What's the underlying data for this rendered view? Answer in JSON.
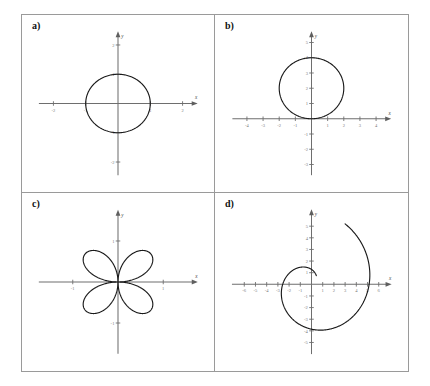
{
  "figure": {
    "panels": [
      {
        "id": "a",
        "label": "a)",
        "xlabel": "x",
        "ylabel": "y",
        "xticks": [
          -2,
          -1,
          1,
          2
        ],
        "yticks": [
          -2,
          -1,
          1,
          2
        ],
        "xticklabels": [
          "-2",
          "-1",
          "1",
          "2"
        ],
        "yticklabels": [
          "-2",
          "-1",
          "1",
          "2"
        ],
        "xlim": [
          -2.45,
          2.45
        ],
        "ylim": [
          -2.45,
          2.45
        ]
      },
      {
        "id": "b",
        "label": "b)",
        "xlabel": "x",
        "ylabel": "y",
        "xticks": [
          -4,
          -3,
          -2,
          -1,
          1,
          2,
          3,
          4
        ],
        "yticks": [
          -3,
          -2,
          -1,
          1,
          2,
          3,
          4,
          5
        ],
        "xticklabels": [
          "-4",
          "-3",
          "-2",
          "-1",
          "1",
          "2",
          "3",
          "4"
        ],
        "yticklabels": [
          "-3",
          "-2",
          "-1",
          "1",
          "2",
          "3",
          "4",
          "5"
        ],
        "xlim": [
          -4.9,
          4.9
        ],
        "ylim": [
          -3.7,
          5.7
        ]
      },
      {
        "id": "c",
        "label": "c)",
        "xlabel": "x",
        "ylabel": "y",
        "xticks": [
          -1,
          1
        ],
        "yticks": [
          -1,
          1
        ],
        "xticklabels": [
          "-1",
          "1"
        ],
        "yticklabels": [
          "-1",
          "1"
        ],
        "xlim": [
          -1.75,
          1.75
        ],
        "ylim": [
          -1.75,
          1.75
        ]
      },
      {
        "id": "d",
        "label": "d)",
        "xlabel": "x",
        "ylabel": "y",
        "xticks": [
          -6,
          -5,
          -4,
          -3,
          -2,
          -1,
          1,
          2,
          3,
          4,
          5,
          6
        ],
        "yticks": [
          -5,
          -4,
          -3,
          -2,
          -1,
          1,
          2,
          3,
          4,
          5
        ],
        "xticklabels": [
          "-6",
          "-5",
          "-4",
          "-3",
          "-2",
          "-1",
          "1",
          "2",
          "3",
          "4",
          "5",
          "6"
        ],
        "yticklabels": [
          "-5",
          "-4",
          "-3",
          "-2",
          "-1",
          "1",
          "2",
          "3",
          "4",
          "5"
        ],
        "xlim": [
          -7.1,
          7.1
        ],
        "ylim": [
          -6.0,
          6.4
        ]
      }
    ]
  },
  "chart_data": [
    {
      "type": "line",
      "panel": "a",
      "title": "",
      "subtitle": "",
      "xlabel": "x",
      "ylabel": "y",
      "xlim": [
        -2.45,
        2.45
      ],
      "ylim": [
        -2.45,
        2.45
      ],
      "grid": false,
      "legend": "none",
      "coordinate_system": "polar",
      "curve": "circle of radius 1 centred at the origin",
      "polar_equation": "r = 1",
      "cartesian_equation": "x^2 + y^2 = 1",
      "center": [
        0,
        0
      ],
      "radius": 1,
      "x_intercepts": [
        -1,
        1
      ],
      "y_intercepts": [
        -1,
        1
      ],
      "xticks": [
        -2,
        -1,
        1,
        2
      ],
      "yticks": [
        -2,
        -1,
        1,
        2
      ],
      "series": [
        {
          "name": "r = 1",
          "theta_start_deg": 0,
          "theta_end_deg": 360,
          "r_values": [
            1,
            1,
            1,
            1,
            1,
            1,
            1,
            1
          ]
        }
      ]
    },
    {
      "type": "line",
      "panel": "b",
      "title": "",
      "subtitle": "",
      "xlabel": "x",
      "ylabel": "y",
      "xlim": [
        -4.9,
        4.9
      ],
      "ylim": [
        -3.7,
        5.7
      ],
      "grid": false,
      "legend": "none",
      "coordinate_system": "polar",
      "curve": "circle of radius 2 centred at (0, 2), tangent to the x-axis at the origin",
      "polar_equation": "r = 4 sin(theta)",
      "cartesian_equation": "x^2 + (y - 2)^2 = 4",
      "center": [
        0,
        2
      ],
      "radius": 2,
      "x_intercepts": [
        0
      ],
      "y_intercepts": [
        0,
        4
      ],
      "xticks": [
        -4,
        -3,
        -2,
        -1,
        1,
        2,
        3,
        4
      ],
      "yticks": [
        -3,
        -2,
        -1,
        1,
        2,
        3,
        4,
        5
      ],
      "series": [
        {
          "name": "r = 4 sin(theta)",
          "theta_start_deg": 0,
          "theta_end_deg": 180,
          "r_values": [
            0,
            2,
            3.46,
            4,
            3.46,
            2,
            0
          ]
        }
      ]
    },
    {
      "type": "line",
      "panel": "c",
      "title": "",
      "subtitle": "",
      "xlabel": "x",
      "ylabel": "y",
      "xlim": [
        -1.75,
        1.75
      ],
      "ylim": [
        -1.75,
        1.75
      ],
      "grid": false,
      "legend": "none",
      "coordinate_system": "polar",
      "curve": "four-petal rose with petals along the diagonals",
      "polar_equation": "r = sin(2 theta)",
      "petals": 4,
      "petal_max_radius": 1,
      "petal_tip_angles_deg": [
        45,
        135,
        225,
        315
      ],
      "petal_tips": [
        [
          0.71,
          0.71
        ],
        [
          -0.71,
          0.71
        ],
        [
          -0.71,
          -0.71
        ],
        [
          0.71,
          -0.71
        ]
      ],
      "xticks": [
        -1,
        1
      ],
      "yticks": [
        -1,
        1
      ],
      "series": [
        {
          "name": "r = sin(2 theta)",
          "theta_start_deg": 0,
          "theta_end_deg": 360,
          "r_values": [
            0,
            0.71,
            1,
            0.71,
            0,
            0.71,
            1,
            0.71,
            0
          ]
        }
      ]
    },
    {
      "type": "line",
      "panel": "d",
      "title": "",
      "subtitle": "",
      "xlabel": "x",
      "ylabel": "y",
      "xlim": [
        -7.1,
        7.1
      ],
      "ylim": [
        -6.0,
        6.4
      ],
      "grid": false,
      "legend": "none",
      "coordinate_system": "polar",
      "curve": "spiral unwinding counter-clockwise from near the origin outward, ending on the positive x-axis at (6, 0)",
      "polar_equation": "r = theta (Archimedean spiral)",
      "theta_start_deg": 60,
      "theta_end_deg": 420,
      "start_point": [
        0.52,
        0.91
      ],
      "end_point": [
        6,
        0
      ],
      "lowest_point": [
        -0.3,
        -5
      ],
      "leftmost_point": [
        -3.2,
        -0.8
      ],
      "xticks": [
        -6,
        -5,
        -4,
        -3,
        -2,
        -1,
        1,
        2,
        3,
        4,
        5,
        6
      ],
      "yticks": [
        -5,
        -4,
        -3,
        -2,
        -1,
        1,
        2,
        3,
        4,
        5
      ],
      "series": [
        {
          "name": "r = theta",
          "theta_deg": [
            60,
            120,
            180,
            240,
            300,
            360,
            420
          ],
          "r_values": [
            1.05,
            2.09,
            3.14,
            4.19,
            5.24,
            6.28,
            7.33
          ]
        }
      ]
    }
  ]
}
